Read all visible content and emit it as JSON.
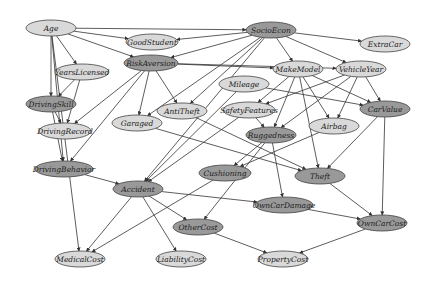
{
  "diagram": {
    "colors": {
      "light": "#d9d9d9",
      "dark": "#999999",
      "stroke": "#444444",
      "edge": "#333333"
    },
    "nodes": [
      {
        "id": "Age",
        "label": "Age",
        "x": 51,
        "y": 28,
        "rx": 25,
        "ry": 8,
        "shade": "light"
      },
      {
        "id": "SocioEcon",
        "label": "SocioEcon",
        "x": 271,
        "y": 30,
        "rx": 25,
        "ry": 8,
        "shade": "dark"
      },
      {
        "id": "GoodStudent",
        "label": "GoodStudent",
        "x": 152,
        "y": 42,
        "rx": 26,
        "ry": 8,
        "shade": "light"
      },
      {
        "id": "ExtraCar",
        "label": "ExtraCar",
        "x": 385,
        "y": 44,
        "rx": 25,
        "ry": 8,
        "shade": "light"
      },
      {
        "id": "RiskAversion",
        "label": "RiskAversion",
        "x": 151,
        "y": 63,
        "rx": 27,
        "ry": 8,
        "shade": "dark"
      },
      {
        "id": "YearsLicensed",
        "label": "YearsLicensed",
        "x": 82,
        "y": 72,
        "rx": 27,
        "ry": 8,
        "shade": "light"
      },
      {
        "id": "MakeModel",
        "label": "MakeModel",
        "x": 298,
        "y": 69,
        "rx": 25,
        "ry": 8,
        "shade": "light"
      },
      {
        "id": "VehicleYear",
        "label": "VehicleYear",
        "x": 361,
        "y": 69,
        "rx": 25,
        "ry": 8,
        "shade": "light"
      },
      {
        "id": "Mileage",
        "label": "Mileage",
        "x": 244,
        "y": 84,
        "rx": 25,
        "ry": 8,
        "shade": "light"
      },
      {
        "id": "DrivingSkill",
        "label": "DrivingSkill",
        "x": 51,
        "y": 104,
        "rx": 25,
        "ry": 8,
        "shade": "dark"
      },
      {
        "id": "AntiTheft",
        "label": "AntiTheft",
        "x": 182,
        "y": 111,
        "rx": 25,
        "ry": 8,
        "shade": "light"
      },
      {
        "id": "SafetyFeatures",
        "label": "SafetyFeatures",
        "x": 249,
        "y": 110,
        "rx": 26,
        "ry": 8,
        "shade": "light"
      },
      {
        "id": "CarValue",
        "label": "CarValue",
        "x": 385,
        "y": 109,
        "rx": 25,
        "ry": 8,
        "shade": "dark"
      },
      {
        "id": "Garaged",
        "label": "Garaged",
        "x": 137,
        "y": 123,
        "rx": 25,
        "ry": 8,
        "shade": "light"
      },
      {
        "id": "DrivingRecord",
        "label": "DrivingRecord",
        "x": 65,
        "y": 131,
        "rx": 26,
        "ry": 8,
        "shade": "light"
      },
      {
        "id": "Ruggedness",
        "label": "Ruggedness",
        "x": 271,
        "y": 135,
        "rx": 25,
        "ry": 8,
        "shade": "dark"
      },
      {
        "id": "Airbag",
        "label": "Airbag",
        "x": 334,
        "y": 126,
        "rx": 25,
        "ry": 8,
        "shade": "light"
      },
      {
        "id": "DrivingBehavior",
        "label": "DrivingBehavior",
        "x": 64,
        "y": 169,
        "rx": 29,
        "ry": 8,
        "shade": "dark"
      },
      {
        "id": "Cushioning",
        "label": "Cushioning",
        "x": 225,
        "y": 173,
        "rx": 26,
        "ry": 8,
        "shade": "dark"
      },
      {
        "id": "Theft",
        "label": "Theft",
        "x": 320,
        "y": 176,
        "rx": 25,
        "ry": 8,
        "shade": "dark"
      },
      {
        "id": "Accident",
        "label": "Accident",
        "x": 138,
        "y": 189,
        "rx": 25,
        "ry": 8,
        "shade": "dark"
      },
      {
        "id": "OwnCarDamage",
        "label": "OwnCarDamage",
        "x": 284,
        "y": 205,
        "rx": 29,
        "ry": 8,
        "shade": "dark"
      },
      {
        "id": "OtherCost",
        "label": "OtherCost",
        "x": 198,
        "y": 227,
        "rx": 25,
        "ry": 8,
        "shade": "dark"
      },
      {
        "id": "OwnCarCost",
        "label": "OwnCarCost",
        "x": 382,
        "y": 223,
        "rx": 25,
        "ry": 8,
        "shade": "dark"
      },
      {
        "id": "MedicalCost",
        "label": "MedicalCost",
        "x": 80,
        "y": 259,
        "rx": 25,
        "ry": 8,
        "shade": "light"
      },
      {
        "id": "LiabilityCost",
        "label": "LiabilityCost",
        "x": 181,
        "y": 259,
        "rx": 25,
        "ry": 8,
        "shade": "light"
      },
      {
        "id": "PropertyCost",
        "label": "PropertyCost",
        "x": 283,
        "y": 259,
        "rx": 25,
        "ry": 8,
        "shade": "light"
      }
    ],
    "edges": [
      [
        "Age",
        "GoodStudent"
      ],
      [
        "Age",
        "SocioEcon"
      ],
      [
        "Age",
        "RiskAversion"
      ],
      [
        "Age",
        "YearsLicensed"
      ],
      [
        "Age",
        "DrivingSkill"
      ],
      [
        "Age",
        "DrivingBehavior"
      ],
      [
        "Age",
        "MedicalCost"
      ],
      [
        "SocioEcon",
        "GoodStudent"
      ],
      [
        "SocioEcon",
        "RiskAversion"
      ],
      [
        "SocioEcon",
        "ExtraCar"
      ],
      [
        "SocioEcon",
        "MakeModel"
      ],
      [
        "SocioEcon",
        "VehicleYear"
      ],
      [
        "SocioEcon",
        "AntiTheft"
      ],
      [
        "SocioEcon",
        "Garaged"
      ],
      [
        "SocioEcon",
        "Accident"
      ],
      [
        "RiskAversion",
        "MakeModel"
      ],
      [
        "RiskAversion",
        "AntiTheft"
      ],
      [
        "RiskAversion",
        "Garaged"
      ],
      [
        "RiskAversion",
        "DrivingRecord"
      ],
      [
        "RiskAversion",
        "DrivingBehavior"
      ],
      [
        "RiskAversion",
        "VehicleYear"
      ],
      [
        "YearsLicensed",
        "DrivingSkill"
      ],
      [
        "YearsLicensed",
        "DrivingRecord"
      ],
      [
        "DrivingSkill",
        "DrivingRecord"
      ],
      [
        "DrivingSkill",
        "DrivingBehavior"
      ],
      [
        "MakeModel",
        "SafetyFeatures"
      ],
      [
        "MakeModel",
        "Ruggedness"
      ],
      [
        "MakeModel",
        "CarValue"
      ],
      [
        "MakeModel",
        "Airbag"
      ],
      [
        "MakeModel",
        "Theft"
      ],
      [
        "VehicleYear",
        "SafetyFeatures"
      ],
      [
        "VehicleYear",
        "Airbag"
      ],
      [
        "VehicleYear",
        "CarValue"
      ],
      [
        "VehicleYear",
        "Ruggedness"
      ],
      [
        "Mileage",
        "CarValue"
      ],
      [
        "Mileage",
        "Accident"
      ],
      [
        "SafetyFeatures",
        "Ruggedness"
      ],
      [
        "SafetyFeatures",
        "Accident"
      ],
      [
        "Ruggedness",
        "Cushioning"
      ],
      [
        "Ruggedness",
        "OwnCarDamage"
      ],
      [
        "Ruggedness",
        "OtherCost"
      ],
      [
        "Airbag",
        "Cushioning"
      ],
      [
        "AntiTheft",
        "Theft"
      ],
      [
        "Garaged",
        "Theft"
      ],
      [
        "CarValue",
        "Theft"
      ],
      [
        "CarValue",
        "OwnCarCost"
      ],
      [
        "DrivingBehavior",
        "Accident"
      ],
      [
        "Accident",
        "OwnCarDamage"
      ],
      [
        "Accident",
        "OtherCost"
      ],
      [
        "Accident",
        "MedicalCost"
      ],
      [
        "Accident",
        "LiabilityCost"
      ],
      [
        "Cushioning",
        "MedicalCost"
      ],
      [
        "Theft",
        "OwnCarCost"
      ],
      [
        "OwnCarDamage",
        "OwnCarCost"
      ],
      [
        "OtherCost",
        "PropertyCost"
      ],
      [
        "OwnCarCost",
        "PropertyCost"
      ]
    ]
  }
}
